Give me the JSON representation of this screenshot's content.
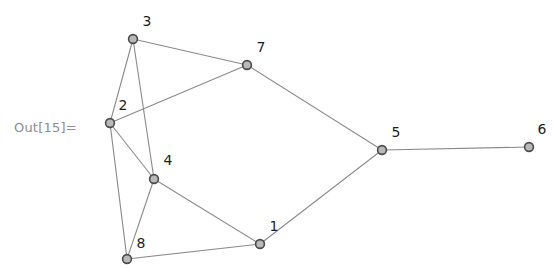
{
  "canvas": {
    "width": 554,
    "height": 268,
    "background": "#ffffff"
  },
  "prompt": {
    "out_label": "Out[15]=",
    "color": "#8d8d8d"
  },
  "graph": {
    "kind": "undirected-node-link-graph",
    "node_style": {
      "fill": "#b9b9b9",
      "stroke": "#4a4a4a",
      "radius": 4.4
    },
    "edge_style": {
      "stroke": "#8a8a8a",
      "width": 1.1
    },
    "label_color": "#1d1d1d",
    "nodes": [
      {
        "id": "1",
        "label": "1",
        "x": 260,
        "y": 244,
        "label_x": 274,
        "label_y": 231
      },
      {
        "id": "2",
        "label": "2",
        "x": 110,
        "y": 123,
        "label_x": 123,
        "label_y": 110
      },
      {
        "id": "3",
        "label": "3",
        "x": 133,
        "y": 39,
        "label_x": 147,
        "label_y": 26
      },
      {
        "id": "4",
        "label": "4",
        "x": 154,
        "y": 179,
        "label_x": 168,
        "label_y": 165
      },
      {
        "id": "5",
        "label": "5",
        "x": 382,
        "y": 150,
        "label_x": 396,
        "label_y": 137
      },
      {
        "id": "6",
        "label": "6",
        "x": 529,
        "y": 147,
        "label_x": 542,
        "label_y": 134
      },
      {
        "id": "7",
        "label": "7",
        "x": 247,
        "y": 65,
        "label_x": 261,
        "label_y": 52
      },
      {
        "id": "8",
        "label": "8",
        "x": 127,
        "y": 259,
        "label_x": 141,
        "label_y": 248
      }
    ],
    "edges": [
      {
        "source": "3",
        "target": "7"
      },
      {
        "source": "3",
        "target": "2"
      },
      {
        "source": "3",
        "target": "4"
      },
      {
        "source": "2",
        "target": "7"
      },
      {
        "source": "2",
        "target": "4"
      },
      {
        "source": "2",
        "target": "8"
      },
      {
        "source": "4",
        "target": "8"
      },
      {
        "source": "4",
        "target": "1"
      },
      {
        "source": "8",
        "target": "1"
      },
      {
        "source": "1",
        "target": "5"
      },
      {
        "source": "7",
        "target": "5"
      },
      {
        "source": "5",
        "target": "6"
      }
    ]
  }
}
